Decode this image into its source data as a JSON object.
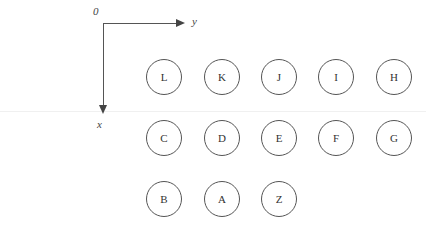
{
  "axes": {
    "origin_label": "0",
    "horizontal_label": "y",
    "vertical_label": "x"
  },
  "rows": [
    {
      "nodes": [
        {
          "label": "L",
          "x": 146,
          "y": 59
        },
        {
          "label": "K",
          "x": 204,
          "y": 59
        },
        {
          "label": "J",
          "x": 261,
          "y": 59
        },
        {
          "label": "I",
          "x": 318,
          "y": 59
        },
        {
          "label": "H",
          "x": 376,
          "y": 59
        }
      ]
    },
    {
      "nodes": [
        {
          "label": "C",
          "x": 146,
          "y": 120
        },
        {
          "label": "D",
          "x": 204,
          "y": 120
        },
        {
          "label": "E",
          "x": 261,
          "y": 120
        },
        {
          "label": "F",
          "x": 318,
          "y": 120
        },
        {
          "label": "G",
          "x": 376,
          "y": 120
        }
      ]
    },
    {
      "nodes": [
        {
          "label": "B",
          "x": 146,
          "y": 181
        },
        {
          "label": "A",
          "x": 204,
          "y": 181
        },
        {
          "label": "Z",
          "x": 261,
          "y": 181
        }
      ]
    }
  ]
}
